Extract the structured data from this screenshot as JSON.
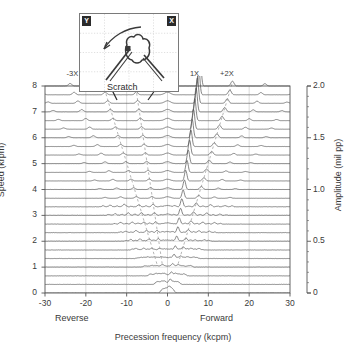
{
  "chart_data": {
    "type": "line",
    "title": "",
    "subtitle": "",
    "xlabel": "Precession frequency (kcpm)",
    "ylabel": "Speed (krpm)",
    "y2label": "Amplitude (mil pp)",
    "xlim": [
      -30,
      30
    ],
    "ylim": [
      0,
      8
    ],
    "y2lim": [
      0,
      2.0
    ],
    "xticks": [
      -30,
      -20,
      -10,
      0,
      10,
      20,
      30
    ],
    "xticklabels": [
      "-30",
      "-20",
      "-10",
      "0",
      "10",
      "20",
      "30"
    ],
    "yticks": [
      0,
      1,
      2,
      3,
      4,
      5,
      6,
      7,
      8
    ],
    "yticklabels": [
      "0",
      "1",
      "2",
      "3",
      "4",
      "5",
      "6",
      "7",
      "8"
    ],
    "y2ticks": [
      0,
      0.5,
      1.0,
      1.5,
      2.0
    ],
    "y2ticklabels": [
      "0",
      "0.5",
      "1.0",
      "1.5",
      "2.0"
    ],
    "grid": true,
    "legend": null,
    "direction_labels": {
      "reverse": "Reverse",
      "forward": "Forward"
    },
    "annotations": [
      {
        "text": "-3X",
        "x": -23.0,
        "y": 8.45
      },
      {
        "text": "1X",
        "x": 7.2,
        "y": 8.45
      },
      {
        "text": "+2X",
        "x": 14.6,
        "y": 8.45
      }
    ],
    "series_description": "Waterfall (cascade) full-spectrum plot: each trace is one spectrum taken at an increasing shaft speed; traces are offset vertically by speed.",
    "trace_speeds": [
      0.0,
      0.33,
      0.66,
      1.0,
      1.33,
      1.66,
      2.0,
      2.33,
      2.66,
      3.0,
      3.33,
      3.66,
      4.0,
      4.33,
      4.66,
      5.0,
      5.33,
      5.66,
      6.0,
      6.33,
      6.66,
      7.0,
      7.33,
      7.66,
      8.0
    ],
    "trace_offset_krpm": 0.333,
    "harmonic_orders": [
      -4,
      -3,
      -2,
      -1,
      1,
      2,
      3,
      4
    ],
    "dashed_guides": [
      {
        "order": -1,
        "label": "-1X tracking line"
      },
      {
        "order": -2,
        "label": "-2X tracking line"
      },
      {
        "order": 2,
        "label": "+2X tracking line"
      }
    ]
  },
  "inset": {
    "badge_y": "Y",
    "badge_x": "X",
    "caption": "Scratch",
    "rotation_arrow": "counter-clockwise-arrow",
    "grid": true
  },
  "icons": {
    "scratch_arrow_left": "arrow-icon",
    "scratch_arrow_right": "arrow-icon",
    "rotation_arrow": "curved-arrow-icon",
    "keyphasor_dot": "square-dot-icon"
  },
  "colors": {
    "trace": "#555555",
    "axis": "#555555",
    "grid": "#cccccc",
    "text": "#3a3a3a",
    "badge_bg": "#2b2b2b",
    "inset_bg": "#ffffff"
  }
}
